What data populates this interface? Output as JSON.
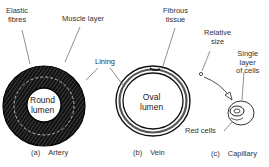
{
  "diagram": {
    "panels": [
      {
        "letter": "(a)",
        "name": "Artery",
        "lumen": [
          "Round",
          "lumen"
        ]
      },
      {
        "letter": "(b)",
        "name": "Vein",
        "lumen": [
          "Oval",
          "lumen"
        ]
      },
      {
        "letter": "(c)",
        "name": "Capillary"
      }
    ],
    "labels": {
      "elastic_fibres": [
        "Elastic",
        "fibres"
      ],
      "muscle_layer": "Muscle layer",
      "lining": "Lining",
      "fibrous_tissue": [
        "Fibrous",
        "tissue"
      ],
      "relative_size": [
        "Relative",
        "size"
      ],
      "single_layer": [
        "Single",
        "layer",
        "of cells"
      ],
      "red_cells": "Red cells"
    },
    "colors": {
      "ink": "#1a1a1a",
      "background": "#ffffff"
    }
  }
}
